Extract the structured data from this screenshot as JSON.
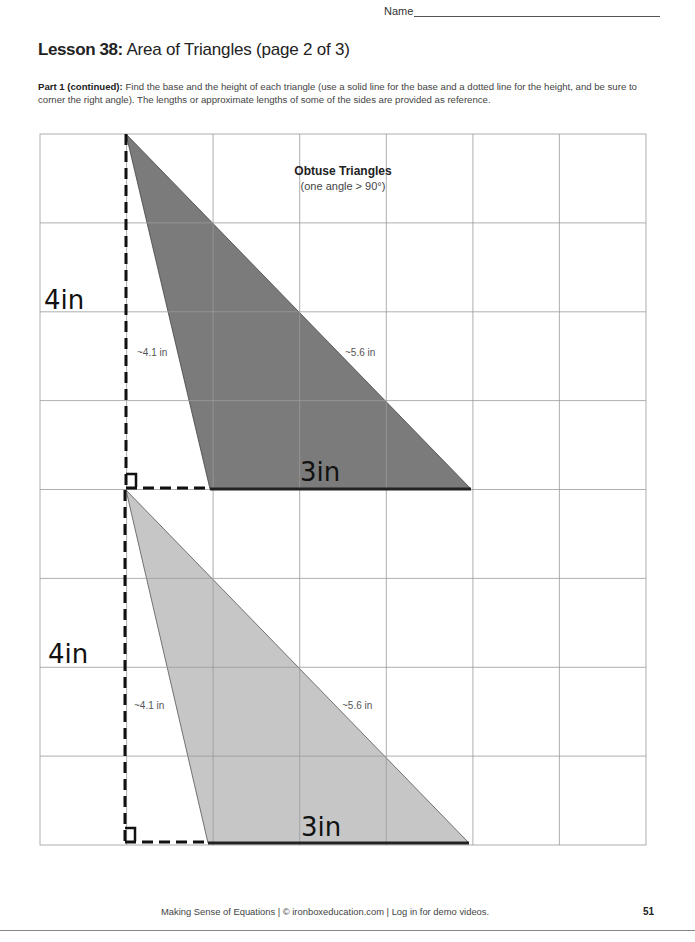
{
  "header": {
    "name_label": "Name"
  },
  "lesson": {
    "number_label": "Lesson 38:",
    "title": " Area of Triangles (page 2 of 3)"
  },
  "instructions": {
    "part_label": "Part 1 (continued):",
    "text": " Find the base and the height of each triangle (use a solid line for the base and a dotted line for the height, and be sure to corner the right angle).  The lengths or approximate lengths of some of the sides are provided as reference."
  },
  "grid": {
    "rows": 8,
    "cols": 7,
    "heading": "Obtuse Triangles",
    "subheading": "(one angle > 90°)"
  },
  "triangles": [
    {
      "fill": "#7b7b7b",
      "side_a_label": "~4.1 in",
      "side_b_label": "~5.6 in",
      "height_label": "4in",
      "base_label": "3in"
    },
    {
      "fill": "#c6c6c6",
      "side_a_label": "~4.1 in",
      "side_b_label": "~5.6 in",
      "height_label": "4in",
      "base_label": "3in"
    }
  ],
  "footer": {
    "text": "Making Sense of Equations | © ironboxeducation.com | Log in for demo videos.",
    "page_number": "51"
  }
}
